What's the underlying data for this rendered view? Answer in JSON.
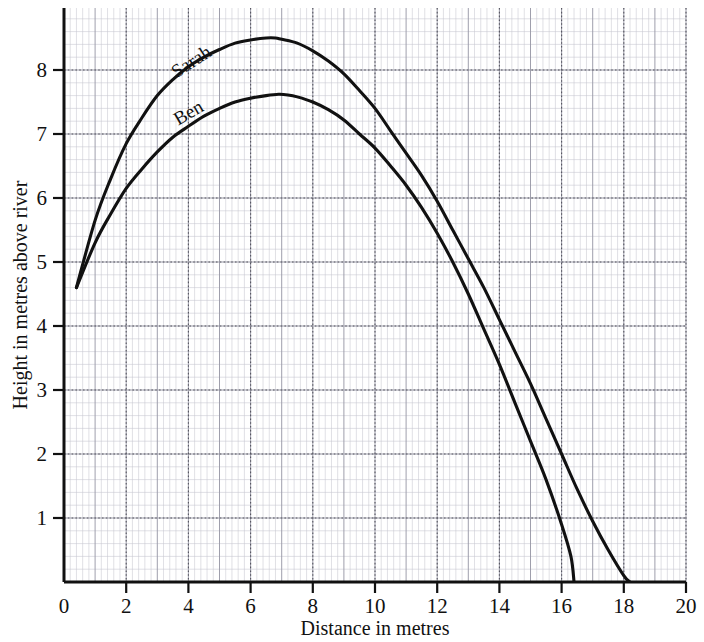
{
  "chart_data": {
    "type": "line",
    "title": "",
    "subtitle": "",
    "xlabel": "Distance in metres",
    "ylabel": "Height in metres above river",
    "xlim": [
      0,
      20
    ],
    "ylim": [
      0,
      8.9
    ],
    "xticks": [
      0,
      2,
      4,
      6,
      8,
      10,
      12,
      14,
      16,
      18,
      20
    ],
    "xticklabels": [
      "0",
      "2",
      "4",
      "6",
      "8",
      "10",
      "12",
      "14",
      "16",
      "18",
      "20"
    ],
    "yticks": [
      1,
      2,
      3,
      4,
      5,
      6,
      7,
      8
    ],
    "yticklabels": [
      "1",
      "2",
      "3",
      "4",
      "5",
      "6",
      "7",
      "8"
    ],
    "grid": true,
    "grid_major_step_x": 1,
    "grid_major_step_y": 1,
    "grid_minor_per_major": 5,
    "legend_position": "inline-on-curves",
    "line_color": "#111111",
    "grid_color": "#b9b9c4",
    "series": [
      {
        "name": "Sarah",
        "label_x": 4.2,
        "label_y": 8.05,
        "label_rotation": -33,
        "points": [
          [
            0.4,
            4.6
          ],
          [
            1.0,
            5.65
          ],
          [
            1.5,
            6.3
          ],
          [
            2.0,
            6.85
          ],
          [
            2.5,
            7.25
          ],
          [
            3.0,
            7.6
          ],
          [
            3.5,
            7.85
          ],
          [
            4.0,
            8.05
          ],
          [
            4.5,
            8.2
          ],
          [
            5.0,
            8.32
          ],
          [
            5.5,
            8.42
          ],
          [
            6.0,
            8.47
          ],
          [
            6.5,
            8.5
          ],
          [
            6.8,
            8.5
          ],
          [
            7.0,
            8.48
          ],
          [
            7.5,
            8.42
          ],
          [
            8.0,
            8.3
          ],
          [
            8.5,
            8.14
          ],
          [
            9.0,
            7.94
          ],
          [
            9.5,
            7.68
          ],
          [
            10.0,
            7.4
          ],
          [
            10.5,
            7.05
          ],
          [
            11.0,
            6.7
          ],
          [
            11.5,
            6.35
          ],
          [
            12.0,
            5.95
          ],
          [
            12.5,
            5.5
          ],
          [
            13.0,
            5.05
          ],
          [
            13.5,
            4.6
          ],
          [
            14.0,
            4.1
          ],
          [
            14.5,
            3.6
          ],
          [
            15.0,
            3.1
          ],
          [
            15.5,
            2.55
          ],
          [
            16.0,
            2.0
          ],
          [
            16.5,
            1.45
          ],
          [
            17.0,
            0.95
          ],
          [
            17.5,
            0.5
          ],
          [
            18.0,
            0.1
          ],
          [
            18.2,
            0.0
          ]
        ]
      },
      {
        "name": "Ben",
        "label_x": 4.1,
        "label_y": 7.25,
        "label_rotation": -30,
        "points": [
          [
            0.4,
            4.6
          ],
          [
            1.0,
            5.3
          ],
          [
            1.5,
            5.75
          ],
          [
            2.0,
            6.15
          ],
          [
            2.5,
            6.45
          ],
          [
            3.0,
            6.72
          ],
          [
            3.5,
            6.95
          ],
          [
            4.0,
            7.12
          ],
          [
            4.5,
            7.28
          ],
          [
            5.0,
            7.4
          ],
          [
            5.5,
            7.5
          ],
          [
            6.0,
            7.56
          ],
          [
            6.5,
            7.6
          ],
          [
            6.9,
            7.62
          ],
          [
            7.2,
            7.61
          ],
          [
            7.5,
            7.58
          ],
          [
            8.0,
            7.5
          ],
          [
            8.5,
            7.38
          ],
          [
            9.0,
            7.22
          ],
          [
            9.5,
            7.0
          ],
          [
            10.0,
            6.78
          ],
          [
            10.5,
            6.5
          ],
          [
            11.0,
            6.2
          ],
          [
            11.5,
            5.85
          ],
          [
            12.0,
            5.45
          ],
          [
            12.5,
            5.0
          ],
          [
            13.0,
            4.5
          ],
          [
            13.5,
            3.95
          ],
          [
            14.0,
            3.4
          ],
          [
            14.5,
            2.8
          ],
          [
            15.0,
            2.2
          ],
          [
            15.5,
            1.6
          ],
          [
            16.0,
            0.9
          ],
          [
            16.3,
            0.4
          ],
          [
            16.4,
            0.0
          ]
        ]
      }
    ]
  }
}
